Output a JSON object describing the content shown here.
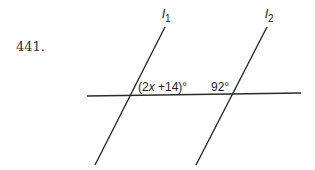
{
  "problem": {
    "number": "441."
  },
  "diagram": {
    "lines": [
      {
        "name": "l1",
        "label_main": "l",
        "label_sub": "1"
      },
      {
        "name": "l2",
        "label_main": "l",
        "label_sub": "2"
      }
    ],
    "angle_labels": {
      "left": "(2x +14)°",
      "left_prefix": "(2",
      "left_var": "x",
      "left_suffix": " +14)°",
      "right": "92°"
    },
    "line_color": "#222222"
  }
}
